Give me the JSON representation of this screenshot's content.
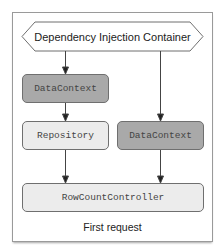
{
  "diagram": {
    "container": {
      "label": "Dependency Injection Container",
      "shape": "hexagon"
    },
    "nodes": [
      {
        "id": "datacontext-1",
        "label": "DataContext",
        "fill": "#a9a9a9"
      },
      {
        "id": "repository",
        "label": "Repository",
        "fill": "#ececec"
      },
      {
        "id": "datacontext-2",
        "label": "DataContext",
        "fill": "#a9a9a9"
      },
      {
        "id": "rowcountcontroller",
        "label": "RowCountController",
        "fill": "#ececec"
      }
    ],
    "edges": [
      {
        "from": "container",
        "to": "datacontext-1"
      },
      {
        "from": "datacontext-1",
        "to": "repository"
      },
      {
        "from": "container",
        "to": "datacontext-2"
      },
      {
        "from": "repository",
        "to": "rowcountcontroller"
      },
      {
        "from": "datacontext-2",
        "to": "rowcountcontroller"
      }
    ],
    "caption": "First request"
  }
}
